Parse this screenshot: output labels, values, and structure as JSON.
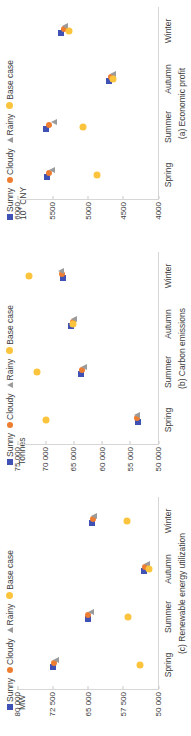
{
  "figure": {
    "seasons": [
      "Spring",
      "Summer",
      "Autumn",
      "Winter"
    ],
    "legend": [
      {
        "label": "Sunny",
        "marker": "square-marker-icon",
        "color": "#3f51b5"
      },
      {
        "label": "Cloudy",
        "marker": "circle-marker-icon",
        "color": "#ed7d31"
      },
      {
        "label": "Rainy",
        "marker": "triangle-marker-icon",
        "color": "#9b9b9b"
      },
      {
        "label": "Base case",
        "marker": "circle-marker-icon",
        "color": "#fcc43c"
      }
    ]
  },
  "chart_data": [
    {
      "type": "scatter",
      "title": "(a) Economic profit",
      "xlabel": "",
      "ylabel": "10⁴ CNY",
      "categories": [
        "Spring",
        "Summer",
        "Autumn",
        "Winter"
      ],
      "yticks": [
        "6000",
        "5500",
        "5000",
        "4500",
        "4000"
      ],
      "ytickvals": [
        6000,
        5500,
        5000,
        4500,
        4000
      ],
      "ylim": [
        4000,
        6000
      ],
      "grid": false,
      "legend_position": "top",
      "series": [
        {
          "name": "Sunny",
          "color": "#3f51b5",
          "values": [
            5570,
            5590,
            4700,
            5370
          ]
        },
        {
          "name": "Cloudy",
          "color": "#ed7d31",
          "values": [
            5540,
            5550,
            4660,
            5340
          ]
        },
        {
          "name": "Rainy",
          "color": "#9b9b9b",
          "values": [
            5510,
            5480,
            4640,
            5320
          ]
        },
        {
          "name": "Base case",
          "color": "#fcc43c",
          "values": [
            4870,
            5070,
            4640,
            5260
          ]
        }
      ]
    },
    {
      "type": "scatter",
      "title": "(b) Carbon emissions",
      "xlabel": "",
      "ylabel": "Tonnes",
      "categories": [
        "Spring",
        "Summer",
        "Autumn",
        "Winter"
      ],
      "yticks": [
        "75 000",
        "70 000",
        "65 000",
        "60 000",
        "55 000",
        "50 000"
      ],
      "ytickvals": [
        75000,
        70000,
        65000,
        60000,
        55000,
        50000
      ],
      "ylim": [
        50000,
        75000
      ],
      "grid": false,
      "legend_position": "top",
      "series": [
        {
          "name": "Sunny",
          "color": "#3f51b5",
          "values": [
            53600,
            63700,
            65400,
            66900
          ]
        },
        {
          "name": "Cloudy",
          "color": "#ed7d31",
          "values": [
            53700,
            63500,
            65100,
            67000
          ]
        },
        {
          "name": "Rainy",
          "color": "#9b9b9b",
          "values": [
            53800,
            63100,
            64900,
            67200
          ]
        },
        {
          "name": "Base case",
          "color": "#fcc43c",
          "values": [
            69800,
            71500,
            65000,
            72900
          ]
        }
      ]
    },
    {
      "type": "scatter",
      "title": "(c) Renewable energy utilization",
      "xlabel": "",
      "ylabel": "MW",
      "categories": [
        "Spring",
        "Summer",
        "Autumn",
        "Winter"
      ],
      "yticks": [
        "80 000",
        "72 500",
        "65 000",
        "57 500",
        "50 000"
      ],
      "ytickvals": [
        80000,
        72500,
        65000,
        57500,
        50000
      ],
      "ylim": [
        50000,
        80000
      ],
      "grid": false,
      "legend_position": "top",
      "series": [
        {
          "name": "Sunny",
          "color": "#3f51b5",
          "values": [
            72300,
            65000,
            53000,
            64100
          ]
        },
        {
          "name": "Cloudy",
          "color": "#ed7d31",
          "values": [
            72100,
            64800,
            52700,
            63900
          ]
        },
        {
          "name": "Rainy",
          "color": "#9b9b9b",
          "values": [
            71700,
            64200,
            52400,
            63600
          ]
        },
        {
          "name": "Base case",
          "color": "#fcc43c",
          "values": [
            53900,
            56400,
            52000,
            56600
          ]
        }
      ]
    }
  ]
}
